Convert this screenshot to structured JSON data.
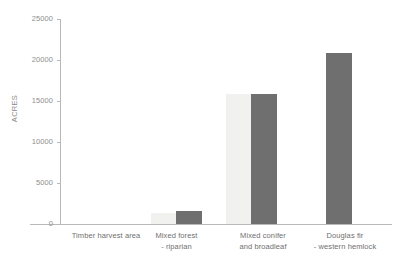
{
  "chart_data": {
    "type": "bar",
    "title": "",
    "xlabel": "",
    "ylabel": "ACRES",
    "ylim": [
      0,
      25000
    ],
    "yticks": [
      0,
      5000,
      10000,
      15000,
      20000,
      25000
    ],
    "ytick_labels": [
      "0",
      "5000",
      "10000",
      "15000",
      "20000",
      "25000"
    ],
    "grid": false,
    "legend": "none",
    "categories": [
      "Timber harvest area",
      "Mixed forest\n- riparian",
      "Mixed conifer\nand broadleaf",
      "Douglas fir\n- western hemlock"
    ],
    "series": [
      {
        "name": "light",
        "color": "#f1f1ef",
        "values": [
          0,
          1300,
          15900,
          0
        ]
      },
      {
        "name": "dark",
        "color": "#6f6f6f",
        "values": [
          0,
          1600,
          15800,
          20800
        ]
      }
    ]
  },
  "axis": {
    "y_title": "ACRES",
    "y_labels": {
      "t0": "0",
      "t1": "5000",
      "t2": "10000",
      "t3": "15000",
      "t4": "20000",
      "t5": "25000"
    }
  },
  "categories": {
    "c0": "Timber harvest area",
    "c1": "Mixed forest\n- riparian",
    "c2": "Mixed conifer\nand broadleaf",
    "c3": "Douglas fir\n- western hemlock"
  }
}
